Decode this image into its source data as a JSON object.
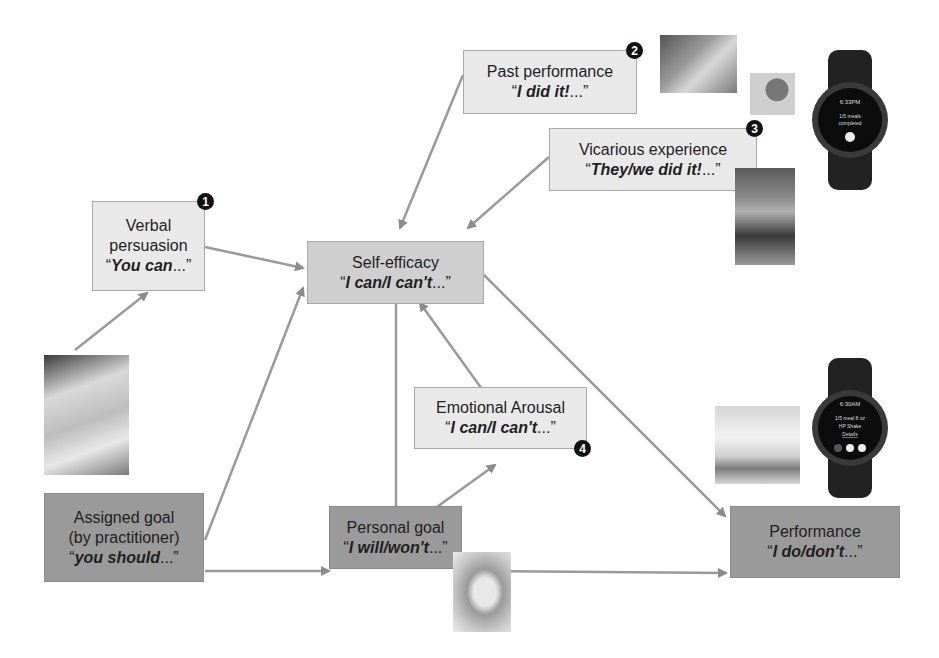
{
  "diagram": {
    "nodes": [
      {
        "id": "past_performance",
        "label": "Past performance",
        "quote": "I did it!",
        "ellipsis": "...",
        "badge": "2"
      },
      {
        "id": "vicarious_experience",
        "label": "Vicarious experience",
        "quote": "They/we did it!",
        "ellipsis": "...",
        "badge": "3"
      },
      {
        "id": "verbal_persuasion",
        "label_line1": "Verbal",
        "label_line2": "persuasion",
        "quote": "You can",
        "ellipsis": "...",
        "badge": "1"
      },
      {
        "id": "self_efficacy",
        "label": "Self-efficacy",
        "quote": "I can/I can't",
        "ellipsis": "..."
      },
      {
        "id": "emotional_arousal",
        "label": "Emotional Arousal",
        "quote": "I can/I can't",
        "ellipsis": "...",
        "badge": "4"
      },
      {
        "id": "assigned_goal",
        "label_line1": "Assigned goal",
        "label_line2": "(by practitioner)",
        "quote": "you should",
        "ellipsis": "..."
      },
      {
        "id": "personal_goal",
        "label": "Personal goal",
        "quote": "I will/won't",
        "ellipsis": "..."
      },
      {
        "id": "performance",
        "label": "Performance",
        "quote": "I do/don't",
        "ellipsis": "..."
      }
    ],
    "edges": [
      {
        "from": "past_performance",
        "to": "self_efficacy"
      },
      {
        "from": "vicarious_experience",
        "to": "self_efficacy"
      },
      {
        "from": "verbal_persuasion",
        "to": "self_efficacy"
      },
      {
        "from": "doctor_photo",
        "to": "verbal_persuasion"
      },
      {
        "from": "assigned_goal",
        "to": "self_efficacy"
      },
      {
        "from": "assigned_goal",
        "to": "personal_goal"
      },
      {
        "from": "self_efficacy",
        "to": "personal_goal"
      },
      {
        "from": "personal_goal",
        "to": "emotional_arousal"
      },
      {
        "from": "emotional_arousal",
        "to": "self_efficacy"
      },
      {
        "from": "self_efficacy",
        "to": "performance"
      },
      {
        "from": "personal_goal",
        "to": "performance"
      }
    ],
    "watches": [
      {
        "id": "watch_top",
        "time": "6:33PM",
        "line1": "1/5 meals",
        "line2": "completed"
      },
      {
        "id": "watch_bottom",
        "time": "6:30AM",
        "line1": "1/5 meal  8 oz",
        "line2": "HP Shake",
        "link": "Details"
      }
    ],
    "open_quote": "“",
    "close_quote": "”"
  }
}
